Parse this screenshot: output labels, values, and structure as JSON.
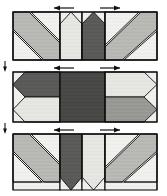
{
  "document": {
    "title": "Quilt Row Assembly Diagram",
    "description": "Three pieced patchwork rows shown stacked vertically with seam-allowance pressing direction arrows above each row and alignment tick marks at the left margin between rows.",
    "width": 167,
    "height": 196
  },
  "palette": {
    "background": "#ffffff",
    "outline": "#111111",
    "fabric_light": "#f2f2f0",
    "fabric_pale": "#e7e7e3",
    "fabric_medium": "#b9b9b5",
    "fabric_medium_dark": "#9a9a96",
    "fabric_dark": "#5c5c5a",
    "fabric_darkest": "#4a4a48"
  },
  "legend": {
    "fabric_light_label": "light fabric",
    "fabric_medium_label": "medium fabric",
    "fabric_dark_label": "dark fabric"
  },
  "rows": [
    {
      "id": "row-1",
      "name": "Row 1",
      "position": "top",
      "x": 13,
      "y": 12,
      "width": 144,
      "height": 48,
      "note": "Flying-geese and diagonal-stripe units; chevrons point up",
      "arrows": [
        {
          "id": "row-1-arrow-left",
          "direction": "left",
          "label": "press left",
          "x": 52,
          "y": 7,
          "length": 22
        },
        {
          "id": "row-1-arrow-right",
          "direction": "right",
          "label": "press right",
          "x": 98,
          "y": 7,
          "length": 22
        }
      ],
      "columns": [
        {
          "id": "r1c1",
          "x": 13,
          "width": 47,
          "fill": "fabric_light",
          "kind": "diagonal-stripe-down"
        },
        {
          "id": "r1c2",
          "x": 60,
          "width": 22,
          "fill": "fabric_pale",
          "kind": "chevron-up-light"
        },
        {
          "id": "r1c3",
          "x": 82,
          "width": 23,
          "fill": "fabric_dark",
          "kind": "chevron-up-dark"
        },
        {
          "id": "r1c4",
          "x": 105,
          "width": 52,
          "fill": "fabric_light",
          "kind": "diagonal-stripe-up"
        }
      ]
    },
    {
      "id": "row-2",
      "name": "Row 2",
      "position": "middle",
      "x": 13,
      "y": 72,
      "width": 144,
      "height": 50,
      "note": "Side-pointing half-square units framing a solid dark center block",
      "arrows": [
        {
          "id": "row-2-arrow-left",
          "direction": "left",
          "label": "press left",
          "x": 52,
          "y": 67,
          "length": 22
        },
        {
          "id": "row-2-arrow-right",
          "direction": "right",
          "label": "press right",
          "x": 98,
          "y": 67,
          "length": 22
        }
      ],
      "columns": [
        {
          "id": "r2c1",
          "x": 13,
          "width": 47,
          "fill": "fabric_dark",
          "kind": "arrow-left-dark-top-light-bottom"
        },
        {
          "id": "r2c2",
          "x": 60,
          "width": 45,
          "fill": "fabric_darkest",
          "kind": "solid-center"
        },
        {
          "id": "r2c3",
          "x": 105,
          "width": 52,
          "fill": "fabric_light",
          "kind": "arrow-right-light-top-dark-bottom"
        }
      ]
    },
    {
      "id": "row-3",
      "name": "Row 3",
      "position": "bottom",
      "x": 13,
      "y": 134,
      "width": 144,
      "height": 56,
      "note": "Mirror of Row 1; chevrons point down",
      "arrows": [
        {
          "id": "row-3-arrow-left",
          "direction": "left",
          "label": "press left",
          "x": 52,
          "y": 129,
          "length": 22
        },
        {
          "id": "row-3-arrow-right",
          "direction": "right",
          "label": "press right",
          "x": 98,
          "y": 129,
          "length": 22
        }
      ],
      "columns": [
        {
          "id": "r3c1",
          "x": 13,
          "width": 47,
          "fill": "fabric_light",
          "kind": "diagonal-stripe-down"
        },
        {
          "id": "r3c2",
          "x": 60,
          "width": 22,
          "fill": "fabric_dark",
          "kind": "chevron-down-dark"
        },
        {
          "id": "r3c3",
          "x": 82,
          "width": 23,
          "fill": "fabric_pale",
          "kind": "chevron-down-light"
        },
        {
          "id": "r3c4",
          "x": 105,
          "width": 52,
          "fill": "fabric_light",
          "kind": "diagonal-stripe-up"
        }
      ]
    }
  ],
  "alignment_marks": [
    {
      "id": "align-mark-1",
      "label": "row alignment tick",
      "x": 5,
      "y": 61,
      "height": 11
    },
    {
      "id": "align-mark-2",
      "label": "row alignment tick",
      "x": 5,
      "y": 123,
      "height": 11
    }
  ]
}
